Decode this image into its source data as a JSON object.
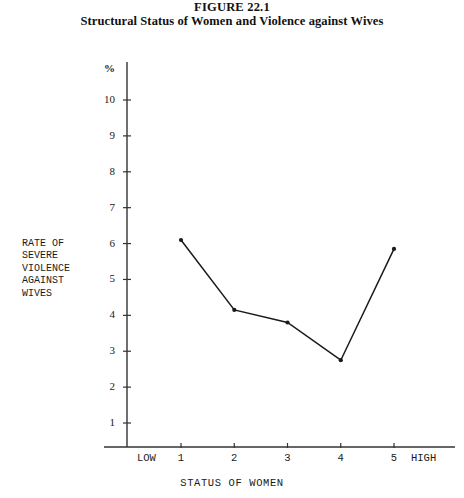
{
  "figure": {
    "number_label": "FIGURE 22.1",
    "title": "Structural Status of Women and Violence against Wives"
  },
  "axis_titles": {
    "y_lines": [
      "RATE OF",
      "SEVERE",
      "VIOLENCE",
      "AGAINST",
      "WIVES"
    ],
    "x": "STATUS OF WOMEN",
    "y_unit": "%"
  },
  "edge_labels": {
    "low": "LOW",
    "high": "HIGH"
  },
  "chart_data": {
    "type": "line",
    "title": "Structural Status of Women and Violence against Wives",
    "xlabel": "STATUS OF WOMEN",
    "ylabel": "RATE OF SEVERE VIOLENCE AGAINST WIVES",
    "yunit": "%",
    "x": [
      1,
      2,
      3,
      4,
      5
    ],
    "categories": [
      "1",
      "2",
      "3",
      "4",
      "5"
    ],
    "xtick_labels": [
      "1",
      "2",
      "3",
      "4",
      "5"
    ],
    "ytick_labels": [
      "1",
      "2",
      "3",
      "4",
      "5",
      "6",
      "7",
      "8",
      "9",
      "10"
    ],
    "values": [
      6.1,
      4.15,
      3.8,
      2.75,
      5.85
    ],
    "xlim": [
      0.5,
      5.6
    ],
    "ylim": [
      0,
      10.6
    ],
    "grid": false,
    "legend": null,
    "series": [
      {
        "name": "Rate of severe violence against wives",
        "values": [
          6.1,
          4.15,
          3.8,
          2.75,
          5.85
        ]
      }
    ],
    "marker": "dot",
    "line_color": "#1a1a1a"
  },
  "style": {
    "background": "#ffffff",
    "ink": "#1a1a1a",
    "axis_color": "#333333"
  }
}
